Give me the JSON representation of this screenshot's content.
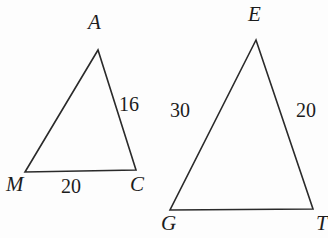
{
  "figure": {
    "background_color": "#fdfdfd",
    "stroke_color": "#2a2a2a",
    "stroke_width": 1.6
  },
  "triangles": [
    {
      "id": "triangle-mac",
      "name": "Triangle MAC",
      "vertices": [
        {
          "label": "A",
          "x": 98,
          "y": 50
        },
        {
          "label": "M",
          "x": 25,
          "y": 172
        },
        {
          "label": "C",
          "x": 136,
          "y": 170
        }
      ],
      "side_labels": [
        {
          "label": "16",
          "side": "AC",
          "value": 16
        },
        {
          "label": "20",
          "side": "MC",
          "value": 20
        }
      ]
    },
    {
      "id": "triangle-get",
      "name": "Triangle GET",
      "vertices": [
        {
          "label": "E",
          "x": 256,
          "y": 40
        },
        {
          "label": "G",
          "x": 170,
          "y": 210
        },
        {
          "label": "T",
          "x": 313,
          "y": 209
        }
      ],
      "side_labels": [
        {
          "label": "30",
          "side": "GE",
          "value": 30
        },
        {
          "label": "20",
          "side": "ET",
          "value": 20
        }
      ]
    }
  ],
  "labels": {
    "A": "A",
    "M": "M",
    "C": "C",
    "E": "E",
    "G": "G",
    "T": "T",
    "sixteen": "16",
    "twenty_left": "20",
    "thirty": "30",
    "twenty_right": "20"
  }
}
